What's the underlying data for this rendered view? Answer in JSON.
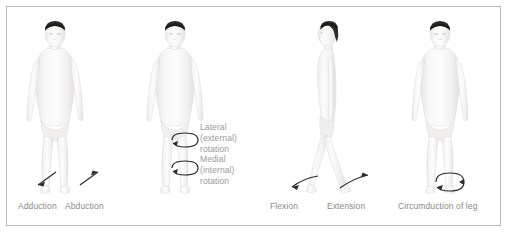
{
  "plate": {
    "background_color": "#ffffff",
    "border_color": "#b9b9b9",
    "text_color": "#8a8a8a",
    "arrow_color": "#2b2b2b",
    "skin_color": "#f3f2f1",
    "skin_shade_color": "#e2e1e0",
    "hair_color": "#2e2b28"
  },
  "panels": [
    {
      "id": "adduction-abduction",
      "view": "anterior",
      "captions": [
        "Adduction",
        "Abduction"
      ],
      "arrows": [
        "adduction-arrow",
        "abduction-arrow"
      ]
    },
    {
      "id": "rotation",
      "view": "anterior",
      "captions": [],
      "arrows": [
        "lateral-rotation-arrow",
        "medial-rotation-arrow"
      ],
      "textblock": [
        "Lateral",
        "(external)",
        "rotation",
        "Medial",
        "(internal)",
        "rotation"
      ]
    },
    {
      "id": "flexion-extension",
      "view": "lateral",
      "captions": [
        "Flexion",
        "Extension"
      ],
      "arrows": [
        "flexion-arrow",
        "extension-arrow"
      ]
    },
    {
      "id": "circumduction",
      "view": "anterior",
      "captions": [
        "Circumduction of leg"
      ],
      "arrows": [
        "circumduction-arrow"
      ]
    }
  ],
  "labels": {
    "adduction": "Adduction",
    "abduction": "Abduction",
    "lateral_l1": "Lateral",
    "lateral_l2": "(external)",
    "lateral_l3": "rotation",
    "medial_l1": "Medial",
    "medial_l2": "(internal)",
    "medial_l3": "rotation",
    "flexion": "Flexion",
    "extension": "Extension",
    "circumduction": "Circumduction of leg"
  }
}
